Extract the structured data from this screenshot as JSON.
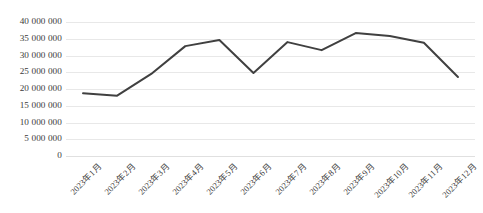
{
  "chart_data": {
    "type": "line",
    "title": "",
    "subtitle": "",
    "xlabel": "",
    "ylabel": "",
    "categories": [
      "2023年1月",
      "2023年2月",
      "2023年3月",
      "2023年4月",
      "2023年5月",
      "2023年6月",
      "2023年7月",
      "2023年8月",
      "2023年9月",
      "2023年10月",
      "2023年11月",
      "2023年12月"
    ],
    "values": [
      18700000,
      18000000,
      24500000,
      32800000,
      34600000,
      24800000,
      34000000,
      31600000,
      36700000,
      35800000,
      33800000,
      23600000
    ],
    "series": [
      {
        "name": "",
        "values": [
          18700000,
          18000000,
          24500000,
          32800000,
          34600000,
          24800000,
          34000000,
          31600000,
          36700000,
          35800000,
          33800000,
          23600000
        ],
        "color": "#404040"
      }
    ],
    "ylim": [
      0,
      40000000
    ],
    "ytick_values": [
      0,
      5000000,
      10000000,
      15000000,
      20000000,
      25000000,
      30000000,
      35000000,
      40000000
    ],
    "ytick_labels": [
      "0",
      "5 000 000",
      "10 000 000",
      "15 000 000",
      "20 000 000",
      "25 000 000",
      "30 000 000",
      "35 000 000",
      "40 000 000"
    ],
    "grid": {
      "horizontal": true,
      "vertical": false,
      "color": "#e8e8e8"
    },
    "legend": {
      "visible": false,
      "position": "none",
      "entries": []
    },
    "annotations": [],
    "markers": false,
    "line_width": 2,
    "xtick_rotation": -45,
    "background_color": "#ffffff",
    "text_color": "#3b3b3b"
  }
}
